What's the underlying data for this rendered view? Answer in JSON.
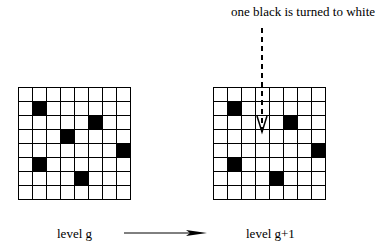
{
  "caption": "one black is turned to white",
  "left": {
    "label": "level g",
    "rows": 8,
    "cols": 8,
    "black_cells": [
      [
        1,
        1
      ],
      [
        2,
        5
      ],
      [
        3,
        3
      ],
      [
        4,
        7
      ],
      [
        5,
        1
      ],
      [
        6,
        4
      ]
    ]
  },
  "right": {
    "label": "level g+1",
    "rows": 8,
    "cols": 8,
    "black_cells": [
      [
        1,
        1
      ],
      [
        2,
        5
      ],
      [
        4,
        7
      ],
      [
        5,
        1
      ],
      [
        6,
        4
      ]
    ],
    "changed_cell": [
      2,
      3
    ]
  },
  "arrows": {
    "transition": "level-transition-arrow",
    "pointer": "dashed-down-arrow"
  }
}
